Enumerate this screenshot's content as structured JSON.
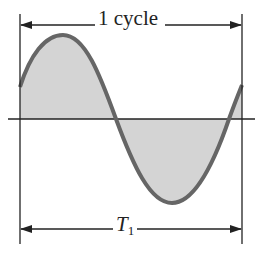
{
  "diagram": {
    "top_dimension_label": "1 cycle",
    "bottom_dimension_label": "T",
    "bottom_dimension_subscript": "1",
    "colors": {
      "wave_stroke": "#666666",
      "fill": "#d4d4d4",
      "lines": "#222222",
      "background": "#ffffff"
    }
  }
}
